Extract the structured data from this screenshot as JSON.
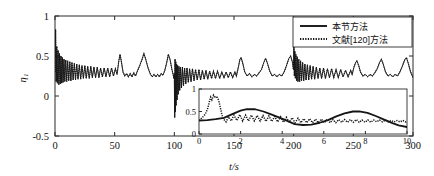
{
  "chart_data": {
    "type": "line",
    "title": "",
    "xlabel": "t/s",
    "ylabel": "η₁",
    "xlim": [
      0,
      300
    ],
    "ylim": [
      -0.5,
      1
    ],
    "xticks": [
      "0",
      "50",
      "100",
      "150",
      "200",
      "250",
      "300"
    ],
    "yticks": [
      "1",
      "0.5",
      "0",
      "-0.5"
    ],
    "grid": false,
    "legend_position": "top-right",
    "series": [
      {
        "name": "本节方法",
        "style": "solid",
        "color": "#151515"
      },
      {
        "name": "文献[120]方法",
        "style": "dotted",
        "color": "#151515"
      }
    ],
    "annotations": [
      {
        "t": 0,
        "value": 0.83,
        "label": "startup transient peak"
      },
      {
        "t": 100,
        "value": -0.27,
        "label": "transient dip"
      },
      {
        "t": 200,
        "value": 0.62,
        "label": "transient peak"
      }
    ],
    "main_series_solid_points": [
      [
        0,
        0.3
      ],
      [
        0.5,
        0.83
      ],
      [
        1,
        0.18
      ],
      [
        1.5,
        0.62
      ],
      [
        2,
        0.16
      ],
      [
        2.6,
        0.57
      ],
      [
        3.2,
        0.14
      ],
      [
        3.8,
        0.53
      ],
      [
        4.4,
        0.15
      ],
      [
        5,
        0.5
      ],
      [
        5.6,
        0.16
      ],
      [
        6.2,
        0.48
      ],
      [
        6.8,
        0.17
      ],
      [
        7.5,
        0.46
      ],
      [
        8.2,
        0.18
      ],
      [
        9,
        0.45
      ],
      [
        9.8,
        0.18
      ],
      [
        10.6,
        0.44
      ],
      [
        11.5,
        0.19
      ],
      [
        12.4,
        0.43
      ],
      [
        13.3,
        0.19
      ],
      [
        14.2,
        0.42
      ],
      [
        15.2,
        0.2
      ],
      [
        16.2,
        0.41
      ],
      [
        17.2,
        0.2
      ],
      [
        18.2,
        0.4
      ],
      [
        19.3,
        0.21
      ],
      [
        20.4,
        0.39
      ],
      [
        21.5,
        0.21
      ],
      [
        22.6,
        0.38
      ],
      [
        23.8,
        0.22
      ],
      [
        25,
        0.38
      ],
      [
        26.2,
        0.22
      ],
      [
        27.4,
        0.37
      ],
      [
        28.7,
        0.22
      ],
      [
        30,
        0.37
      ],
      [
        31.3,
        0.23
      ],
      [
        32.6,
        0.36
      ],
      [
        34,
        0.23
      ],
      [
        35.4,
        0.36
      ],
      [
        36.8,
        0.23
      ],
      [
        38.2,
        0.35
      ],
      [
        39.7,
        0.24
      ],
      [
        41.2,
        0.35
      ],
      [
        42.7,
        0.24
      ],
      [
        44.2,
        0.35
      ],
      [
        45.8,
        0.24
      ],
      [
        47.4,
        0.35
      ],
      [
        49,
        0.25
      ],
      [
        50.6,
        0.34
      ],
      [
        52,
        0.27
      ],
      [
        53.5,
        0.44
      ],
      [
        54.5,
        0.52
      ],
      [
        55.5,
        0.44
      ],
      [
        57,
        0.3
      ],
      [
        58.5,
        0.25
      ],
      [
        60,
        0.28
      ],
      [
        61.5,
        0.24
      ],
      [
        63,
        0.28
      ],
      [
        64.5,
        0.24
      ],
      [
        66,
        0.29
      ],
      [
        67.5,
        0.25
      ],
      [
        69,
        0.31
      ],
      [
        71,
        0.38
      ],
      [
        73,
        0.46
      ],
      [
        74.5,
        0.53
      ],
      [
        76,
        0.46
      ],
      [
        78,
        0.35
      ],
      [
        80,
        0.27
      ],
      [
        81.5,
        0.24
      ],
      [
        83,
        0.27
      ],
      [
        84.5,
        0.24
      ],
      [
        86,
        0.27
      ],
      [
        87.5,
        0.24
      ],
      [
        89,
        0.28
      ],
      [
        90.5,
        0.26
      ],
      [
        92,
        0.32
      ],
      [
        93.5,
        0.41
      ],
      [
        95,
        0.52
      ],
      [
        96.5,
        0.45
      ],
      [
        98,
        0.33
      ],
      [
        99,
        0.27
      ],
      [
        99.6,
        0.22
      ],
      [
        100,
        0.28
      ],
      [
        100.3,
        -0.27
      ],
      [
        100.6,
        0.46
      ],
      [
        100.9,
        -0.2
      ],
      [
        101.2,
        0.43
      ],
      [
        101.5,
        -0.12
      ],
      [
        101.9,
        0.4
      ],
      [
        102.3,
        -0.05
      ],
      [
        102.8,
        0.38
      ],
      [
        103.3,
        0.02
      ],
      [
        103.9,
        0.37
      ],
      [
        104.5,
        0.07
      ],
      [
        105.2,
        0.36
      ],
      [
        106,
        0.1
      ],
      [
        106.8,
        0.36
      ],
      [
        107.7,
        0.13
      ],
      [
        108.6,
        0.35
      ],
      [
        109.6,
        0.15
      ],
      [
        110.6,
        0.35
      ],
      [
        111.7,
        0.17
      ],
      [
        112.8,
        0.34
      ],
      [
        114,
        0.18
      ],
      [
        115.2,
        0.34
      ],
      [
        116.5,
        0.19
      ],
      [
        117.8,
        0.33
      ],
      [
        119.2,
        0.2
      ],
      [
        120.6,
        0.33
      ],
      [
        122,
        0.2
      ],
      [
        123.5,
        0.32
      ],
      [
        125,
        0.21
      ],
      [
        126.5,
        0.32
      ],
      [
        128,
        0.21
      ],
      [
        129.6,
        0.31
      ],
      [
        131.2,
        0.22
      ],
      [
        132.8,
        0.31
      ],
      [
        134.5,
        0.22
      ],
      [
        136.2,
        0.31
      ],
      [
        138,
        0.22
      ],
      [
        139.8,
        0.3
      ],
      [
        141.6,
        0.23
      ],
      [
        143.4,
        0.3
      ],
      [
        145.2,
        0.23
      ],
      [
        147,
        0.3
      ],
      [
        148.9,
        0.23
      ],
      [
        150.8,
        0.3
      ],
      [
        152,
        0.25
      ],
      [
        153.5,
        0.35
      ],
      [
        155,
        0.46
      ],
      [
        156,
        0.48
      ],
      [
        157.5,
        0.4
      ],
      [
        159,
        0.3
      ],
      [
        161,
        0.25
      ],
      [
        163,
        0.28
      ],
      [
        165,
        0.24
      ],
      [
        167,
        0.27
      ],
      [
        169,
        0.25
      ],
      [
        171,
        0.29
      ],
      [
        173,
        0.33
      ],
      [
        175,
        0.42
      ],
      [
        176.5,
        0.47
      ],
      [
        178,
        0.41
      ],
      [
        180,
        0.31
      ],
      [
        182,
        0.25
      ],
      [
        184,
        0.27
      ],
      [
        186,
        0.24
      ],
      [
        188,
        0.27
      ],
      [
        190,
        0.25
      ],
      [
        192,
        0.3
      ],
      [
        194,
        0.38
      ],
      [
        196,
        0.47
      ],
      [
        197.5,
        0.5
      ],
      [
        199,
        0.42
      ],
      [
        199.8,
        0.33
      ],
      [
        200.2,
        0.62
      ],
      [
        200.6,
        0.25
      ],
      [
        201,
        0.56
      ],
      [
        201.4,
        0.22
      ],
      [
        201.9,
        0.52
      ],
      [
        202.4,
        0.19
      ],
      [
        203,
        0.49
      ],
      [
        203.6,
        0.18
      ],
      [
        204.3,
        0.46
      ],
      [
        205,
        0.18
      ],
      [
        205.8,
        0.44
      ],
      [
        206.6,
        0.19
      ],
      [
        207.5,
        0.42
      ],
      [
        208.4,
        0.19
      ],
      [
        209.4,
        0.4
      ],
      [
        210.4,
        0.2
      ],
      [
        211.5,
        0.39
      ],
      [
        212.6,
        0.2
      ],
      [
        213.8,
        0.38
      ],
      [
        215,
        0.21
      ],
      [
        216.3,
        0.37
      ],
      [
        217.6,
        0.21
      ],
      [
        219,
        0.36
      ],
      [
        220.4,
        0.22
      ],
      [
        221.9,
        0.35
      ],
      [
        223.4,
        0.22
      ],
      [
        225,
        0.35
      ],
      [
        226.6,
        0.22
      ],
      [
        228.3,
        0.34
      ],
      [
        230,
        0.23
      ],
      [
        231.8,
        0.34
      ],
      [
        233.6,
        0.23
      ],
      [
        235.5,
        0.33
      ],
      [
        237.4,
        0.23
      ],
      [
        239.4,
        0.33
      ],
      [
        241.4,
        0.24
      ],
      [
        243.5,
        0.32
      ],
      [
        245.6,
        0.24
      ],
      [
        247.8,
        0.32
      ],
      [
        249,
        0.27
      ],
      [
        250.5,
        0.36
      ],
      [
        252,
        0.42
      ],
      [
        253,
        0.44
      ],
      [
        254.5,
        0.38
      ],
      [
        256,
        0.3
      ],
      [
        258,
        0.25
      ],
      [
        260,
        0.27
      ],
      [
        262,
        0.24
      ],
      [
        264,
        0.27
      ],
      [
        266,
        0.25
      ],
      [
        268,
        0.29
      ],
      [
        270,
        0.34
      ],
      [
        272,
        0.42
      ],
      [
        273.5,
        0.46
      ],
      [
        275,
        0.4
      ],
      [
        277,
        0.3
      ],
      [
        279,
        0.25
      ],
      [
        281,
        0.27
      ],
      [
        283,
        0.24
      ],
      [
        285,
        0.27
      ],
      [
        287,
        0.25
      ],
      [
        289,
        0.3
      ],
      [
        291,
        0.37
      ],
      [
        293,
        0.45
      ],
      [
        294.5,
        0.48
      ],
      [
        296,
        0.41
      ],
      [
        298,
        0.3
      ],
      [
        300,
        0.23
      ]
    ]
  },
  "inset": {
    "xlabel": "",
    "ylabel": "",
    "xlim": [
      0,
      10
    ],
    "ylim": [
      0,
      1
    ],
    "xticks": [
      "0",
      "2",
      "4",
      "6",
      "8",
      "10"
    ],
    "yticks": [
      "0",
      "0.5",
      "1"
    ],
    "series": [
      {
        "name": "本节方法",
        "style": "solid-thick"
      },
      {
        "name": "文献[120]方法",
        "style": "dotted"
      }
    ],
    "smooth_points": [
      [
        0,
        0.3
      ],
      [
        0.4,
        0.31
      ],
      [
        0.8,
        0.33
      ],
      [
        1.2,
        0.36
      ],
      [
        1.6,
        0.44
      ],
      [
        2.0,
        0.52
      ],
      [
        2.3,
        0.555
      ],
      [
        2.7,
        0.55
      ],
      [
        3.1,
        0.5
      ],
      [
        3.5,
        0.43
      ],
      [
        3.9,
        0.36
      ],
      [
        4.3,
        0.28
      ],
      [
        4.6,
        0.22
      ],
      [
        5.0,
        0.2
      ],
      [
        5.4,
        0.21
      ],
      [
        5.8,
        0.25
      ],
      [
        6.2,
        0.31
      ],
      [
        6.6,
        0.39
      ],
      [
        7.0,
        0.46
      ],
      [
        7.4,
        0.5
      ],
      [
        7.7,
        0.505
      ],
      [
        8.1,
        0.47
      ],
      [
        8.5,
        0.4
      ],
      [
        8.9,
        0.32
      ],
      [
        9.3,
        0.24
      ],
      [
        9.6,
        0.19
      ],
      [
        10,
        0.155
      ]
    ],
    "oscillating_points": [
      [
        0,
        0.3
      ],
      [
        0.15,
        0.36
      ],
      [
        0.3,
        0.44
      ],
      [
        0.42,
        0.57
      ],
      [
        0.5,
        0.72
      ],
      [
        0.56,
        0.82
      ],
      [
        0.62,
        0.76
      ],
      [
        0.7,
        0.86
      ],
      [
        0.78,
        0.8
      ],
      [
        0.86,
        0.84
      ],
      [
        0.95,
        0.74
      ],
      [
        1.02,
        0.6
      ],
      [
        1.1,
        0.43
      ],
      [
        1.18,
        0.33
      ],
      [
        1.3,
        0.27
      ],
      [
        1.42,
        0.38
      ],
      [
        1.55,
        0.29
      ],
      [
        1.68,
        0.42
      ],
      [
        1.82,
        0.3
      ],
      [
        1.96,
        0.43
      ],
      [
        2.1,
        0.29
      ],
      [
        2.24,
        0.42
      ],
      [
        2.38,
        0.29
      ],
      [
        2.52,
        0.42
      ],
      [
        2.66,
        0.29
      ],
      [
        2.8,
        0.41
      ],
      [
        2.94,
        0.29
      ],
      [
        3.08,
        0.41
      ],
      [
        3.22,
        0.28
      ],
      [
        3.36,
        0.4
      ],
      [
        3.5,
        0.28
      ],
      [
        3.64,
        0.39
      ],
      [
        3.78,
        0.27
      ],
      [
        3.92,
        0.38
      ],
      [
        4.06,
        0.26
      ],
      [
        4.2,
        0.37
      ],
      [
        4.34,
        0.26
      ],
      [
        4.48,
        0.36
      ],
      [
        4.62,
        0.25
      ],
      [
        4.76,
        0.35
      ],
      [
        4.9,
        0.25
      ],
      [
        5.04,
        0.34
      ],
      [
        5.18,
        0.25
      ],
      [
        5.32,
        0.34
      ],
      [
        5.46,
        0.25
      ],
      [
        5.6,
        0.33
      ],
      [
        5.74,
        0.25
      ],
      [
        5.88,
        0.33
      ],
      [
        6.02,
        0.25
      ],
      [
        6.16,
        0.33
      ],
      [
        6.3,
        0.25
      ],
      [
        6.44,
        0.32
      ],
      [
        6.58,
        0.25
      ],
      [
        6.72,
        0.32
      ],
      [
        6.86,
        0.26
      ],
      [
        7.0,
        0.32
      ],
      [
        7.14,
        0.26
      ],
      [
        7.28,
        0.32
      ],
      [
        7.42,
        0.26
      ],
      [
        7.56,
        0.32
      ],
      [
        7.7,
        0.26
      ],
      [
        7.84,
        0.31
      ],
      [
        7.98,
        0.26
      ],
      [
        8.12,
        0.31
      ],
      [
        8.26,
        0.26
      ],
      [
        8.4,
        0.31
      ],
      [
        8.54,
        0.27
      ],
      [
        8.68,
        0.31
      ],
      [
        8.82,
        0.27
      ],
      [
        8.96,
        0.31
      ],
      [
        9.1,
        0.27
      ],
      [
        9.24,
        0.3
      ],
      [
        9.38,
        0.27
      ],
      [
        9.52,
        0.3
      ],
      [
        9.66,
        0.27
      ],
      [
        9.8,
        0.3
      ],
      [
        9.94,
        0.27
      ],
      [
        10,
        0.29
      ]
    ]
  },
  "legend": {
    "items": [
      {
        "label": "本节方法",
        "style": "solid"
      },
      {
        "label": "文献[120]方法",
        "style": "dotted"
      }
    ]
  }
}
